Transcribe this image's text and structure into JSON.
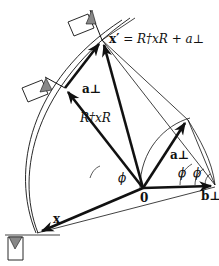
{
  "diagram": {
    "type": "geometric-rotation-translation",
    "labels": {
      "x_prime_equation": "x′ = R†xR + a⊥",
      "x_prime_symbol": "x′",
      "equation_rhs": "= R†xR + a⊥",
      "rotated_x": "R†xR",
      "x": "x",
      "a_perp_upper": "a⊥",
      "a_perp_right": "a⊥",
      "b_perp": "b⊥",
      "origin": "0",
      "phi_left": "ϕ",
      "phi_mid": "ϕ",
      "phi_right": "ϕ"
    },
    "points": {
      "origin": [
        143,
        188
      ],
      "x_tip": [
        37,
        233
      ],
      "rotated_x_tip": [
        65,
        88
      ],
      "x_prime_tip": [
        102,
        40
      ],
      "a_perp_tip": [
        188,
        120
      ],
      "b_perp_tip": [
        215,
        185
      ]
    },
    "flags": [
      {
        "name": "flag-top",
        "pole_base": [
          102,
          40
        ]
      },
      {
        "name": "flag-middle",
        "pole_base": [
          65,
          88
        ]
      },
      {
        "name": "flag-bottom",
        "pole_base": [
          37,
          233
        ]
      }
    ],
    "colors": {
      "line": "#111111",
      "flag_fill": "#888888",
      "background": "#ffffff"
    }
  }
}
